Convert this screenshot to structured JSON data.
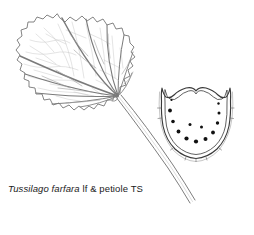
{
  "figure": {
    "caption": {
      "scientific_name": "Tussilago farfara",
      "descriptor": "lf & petiole TS",
      "full_text": "Tussilago farfara lf & petiole TS"
    },
    "background_color": "#ffffff",
    "ink_color": "#4a4a4a",
    "dark_ink_color": "#2b2b2b",
    "faint_vein_color": "#b9b9b9",
    "bundle_color": "#111111",
    "panels": [
      {
        "name": "leaf-blade",
        "label": "palmate leaf blade with dentate margin"
      },
      {
        "name": "petiole-stalk",
        "label": "curving petiole stalk"
      },
      {
        "name": "petiole-transverse-section",
        "label": "petiole transverse section with vascular bundles",
        "vascular_bundle_count": 13
      }
    ],
    "vascular_bundles": [
      {
        "cx": 171.5,
        "cy": 100.0,
        "r": 1.1
      },
      {
        "cx": 170.0,
        "cy": 110.5,
        "r": 1.9
      },
      {
        "cx": 173.0,
        "cy": 121.5,
        "r": 1.8
      },
      {
        "cx": 178.5,
        "cy": 131.5,
        "r": 1.9
      },
      {
        "cx": 186.5,
        "cy": 138.5,
        "r": 2.1
      },
      {
        "cx": 196.0,
        "cy": 141.5,
        "r": 2.1
      },
      {
        "cx": 205.5,
        "cy": 139.0,
        "r": 2.0
      },
      {
        "cx": 213.0,
        "cy": 132.5,
        "r": 1.9
      },
      {
        "cx": 217.5,
        "cy": 123.0,
        "r": 1.7
      },
      {
        "cx": 219.0,
        "cy": 113.0,
        "r": 1.5
      },
      {
        "cx": 218.5,
        "cy": 103.5,
        "r": 1.2
      },
      {
        "cx": 190.0,
        "cy": 124.5,
        "r": 1.5
      },
      {
        "cx": 201.5,
        "cy": 127.0,
        "r": 1.5
      }
    ]
  }
}
